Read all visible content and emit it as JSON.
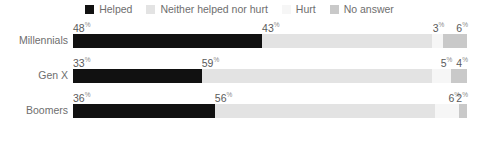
{
  "legend": {
    "items": [
      {
        "label": "Helped",
        "color": "#111111",
        "swatch_icon": "square-swatch-icon"
      },
      {
        "label": "Neither helped nor hurt",
        "color": "#e3e3e3",
        "swatch_icon": "square-swatch-icon"
      },
      {
        "label": "Hurt",
        "color": "#f6f6f6",
        "swatch_icon": "square-swatch-icon"
      },
      {
        "label": "No answer",
        "color": "#c9c9c9",
        "swatch_icon": "square-swatch-icon"
      }
    ]
  },
  "chart_data": {
    "type": "bar",
    "orientation": "horizontal",
    "stacked": true,
    "stacked_percent": true,
    "title": "",
    "subtitle": "",
    "xlabel": "",
    "ylabel": "",
    "xlim": [
      0,
      100
    ],
    "grid": false,
    "legend_position": "top-center",
    "categories": [
      "Millennials",
      "Gen X",
      "Boomers"
    ],
    "series": [
      {
        "name": "Helped",
        "color": "#111111",
        "values": [
          48,
          33,
          36
        ]
      },
      {
        "name": "Neither helped nor hurt",
        "color": "#e3e3e3",
        "values": [
          43,
          59,
          56
        ]
      },
      {
        "name": "Hurt",
        "color": "#f6f6f6",
        "values": [
          3,
          5,
          6
        ]
      },
      {
        "name": "No answer",
        "color": "#c9c9c9",
        "values": [
          6,
          4,
          2
        ]
      }
    ],
    "value_suffix": "%"
  },
  "rows": [
    {
      "label": "Millennials",
      "segments": [
        {
          "name": "Helped",
          "value": "48",
          "suffix": "%"
        },
        {
          "name": "Neither helped nor hurt",
          "value": "43",
          "suffix": "%"
        },
        {
          "name": "Hurt",
          "value": "3",
          "suffix": "%"
        },
        {
          "name": "No answer",
          "value": "6",
          "suffix": "%"
        }
      ]
    },
    {
      "label": "Gen X",
      "segments": [
        {
          "name": "Helped",
          "value": "33",
          "suffix": "%"
        },
        {
          "name": "Neither helped nor hurt",
          "value": "59",
          "suffix": "%"
        },
        {
          "name": "Hurt",
          "value": "5",
          "suffix": "%"
        },
        {
          "name": "No answer",
          "value": "4",
          "suffix": "%"
        }
      ]
    },
    {
      "label": "Boomers",
      "segments": [
        {
          "name": "Helped",
          "value": "36",
          "suffix": "%"
        },
        {
          "name": "Neither helped nor hurt",
          "value": "56",
          "suffix": "%"
        },
        {
          "name": "Hurt",
          "value": "6",
          "suffix": "%"
        },
        {
          "name": "No answer",
          "value": "2",
          "suffix": "%"
        }
      ]
    }
  ]
}
